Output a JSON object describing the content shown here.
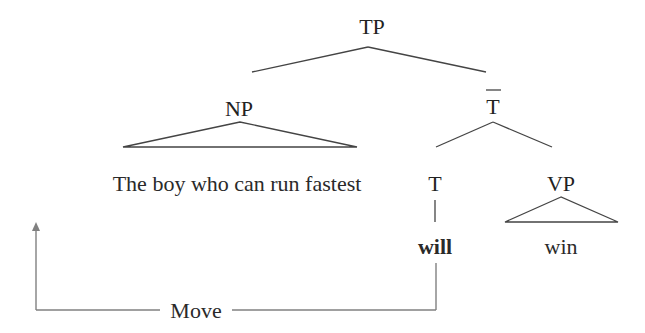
{
  "tree": {
    "root": {
      "label": "TP"
    },
    "np": {
      "label": "NP",
      "content": "The boy who can run fastest",
      "triangle": true
    },
    "tbar": {
      "label": "T",
      "bar": true
    },
    "t": {
      "label": "T",
      "word": "will",
      "word_bold": true
    },
    "vp": {
      "label": "VP",
      "content": "win",
      "triangle": true
    }
  },
  "movement": {
    "label": "Move",
    "from": "will",
    "to": "The boy who can run fastest",
    "arrow": "up"
  },
  "colors": {
    "text": "#222222",
    "branch": "#444444",
    "move_line": "#808080",
    "background": "#ffffff"
  }
}
